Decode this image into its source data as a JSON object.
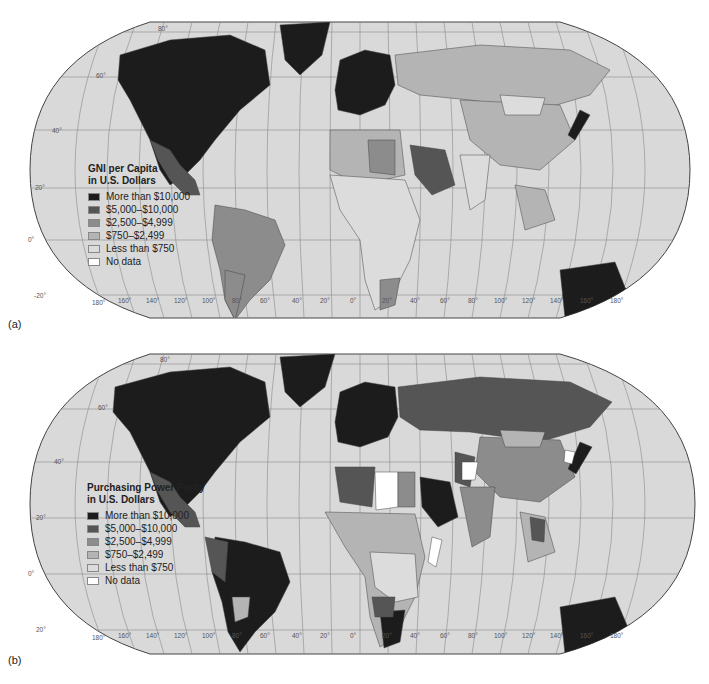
{
  "figure": {
    "panels": [
      {
        "label": "(a)",
        "legend": {
          "title": "GNI per Capita\nin U.S. Dollars",
          "items": [
            {
              "label": "More than $10,000",
              "color": "#1c1c1c"
            },
            {
              "label": "$5,000–$10,000",
              "color": "#555555"
            },
            {
              "label": "$2,500–$4,999",
              "color": "#8c8c8c"
            },
            {
              "label": "$750–$2,499",
              "color": "#b4b4b4"
            },
            {
              "label": "Less than $750",
              "color": "#dcdcdc"
            },
            {
              "label": "No data",
              "color": "#ffffff"
            }
          ]
        }
      },
      {
        "label": "(b)",
        "legend": {
          "title": "Purchasing Power Parity\nin U.S. Dollars",
          "items": [
            {
              "label": "More than $10,000",
              "color": "#1c1c1c"
            },
            {
              "label": "$5,000–$10,000",
              "color": "#555555"
            },
            {
              "label": "$2,500–$4,999",
              "color": "#8c8c8c"
            },
            {
              "label": "$750–$2,499",
              "color": "#b4b4b4"
            },
            {
              "label": "Less than $750",
              "color": "#dcdcdc"
            },
            {
              "label": "No data",
              "color": "#ffffff"
            }
          ]
        }
      }
    ],
    "latitude_labels": [
      "80°",
      "60°",
      "40°",
      "20°",
      "0°",
      "-20°",
      "-40°",
      "60°"
    ],
    "longitude_labels": [
      "180°",
      "160°",
      "140°",
      "120°",
      "100°",
      "80°",
      "60°",
      "40°",
      "20°",
      "0°",
      "20°",
      "40°",
      "60°",
      "80°",
      "100°",
      "120°",
      "140°",
      "160°",
      "180°"
    ],
    "colors": {
      "ocean": "#d9d9d9",
      "grid": "#8a8a8a",
      "border": "#444444"
    }
  }
}
